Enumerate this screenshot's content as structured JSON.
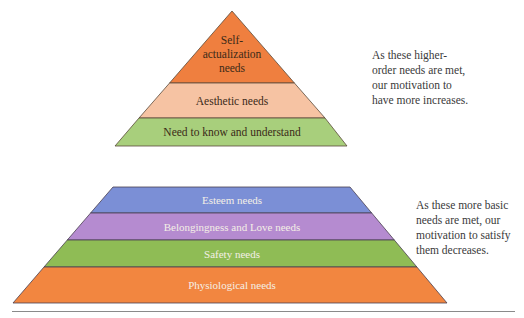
{
  "top_pyramid": {
    "levels": [
      {
        "label_lines": [
          "Self-",
          "actualization",
          "needs"
        ],
        "color": "#ef7f3f"
      },
      {
        "label": "Aesthetic needs",
        "color": "#f6c3a3"
      },
      {
        "label": "Need to know and understand",
        "color": "#a8cf7c"
      }
    ],
    "caption_lines": [
      "As these higher-",
      "order needs are met,",
      "our motivation to",
      "have more increases."
    ]
  },
  "bottom_pyramid": {
    "levels": [
      {
        "label": "Esteem needs",
        "color": "#7b8fd6"
      },
      {
        "label": "Belongingness and Love needs",
        "color": "#b58bd0"
      },
      {
        "label": "Safety needs",
        "color": "#8fbc55"
      },
      {
        "label": "Physiological needs",
        "color": "#f28640"
      }
    ],
    "caption_lines": [
      "As these more basic",
      "needs are met, our",
      "motivation to satisfy",
      "them decreases."
    ]
  },
  "colors": {
    "outline": "#5a4a3a",
    "rule": "#8a8a8a"
  }
}
